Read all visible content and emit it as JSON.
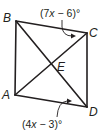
{
  "diagram": {
    "points": {
      "A": {
        "label": "A",
        "x": 15,
        "y": 95
      },
      "B": {
        "label": "B",
        "x": 16,
        "y": 21
      },
      "C": {
        "label": "C",
        "x": 87,
        "y": 33
      },
      "D": {
        "label": "D",
        "x": 87,
        "y": 107
      },
      "E": {
        "label": "E",
        "x": 51,
        "y": 64
      }
    },
    "segments": [
      "AB",
      "BC",
      "CD",
      "DA",
      "AC",
      "BD"
    ],
    "angles": {
      "top": {
        "expr_pre": "(7",
        "var": "x",
        "expr_post": " − 6)°",
        "at": "angle BCA"
      },
      "bottom": {
        "expr_pre": "(4",
        "var": "x",
        "expr_post": " − 3)°",
        "at": "angle ADB"
      }
    },
    "colors": {
      "stroke": "#231f20",
      "background": "#ffffff"
    }
  }
}
